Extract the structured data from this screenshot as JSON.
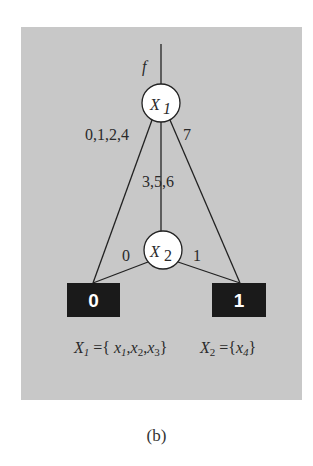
{
  "diagram": {
    "root_label": "f",
    "nodes": [
      {
        "id": "X1",
        "label": "X",
        "subscript": "1"
      },
      {
        "id": "X2",
        "label": "X",
        "subscript": "2"
      }
    ],
    "terminals": [
      {
        "id": "t0",
        "label": "0"
      },
      {
        "id": "t1",
        "label": "1"
      }
    ],
    "edges": [
      {
        "from": "X1",
        "to": "t0",
        "label": "0,1,2,4"
      },
      {
        "from": "X1",
        "to": "X2",
        "label": "3,5,6"
      },
      {
        "from": "X1",
        "to": "t1",
        "label": "7"
      },
      {
        "from": "X2",
        "to": "t0",
        "label": "0"
      },
      {
        "from": "X2",
        "to": "t1",
        "label": "1"
      }
    ],
    "legend": {
      "x1_def": "X1={ x1,x2,x3}",
      "x2_def": "X2={x4}"
    },
    "colors": {
      "background": "#c8c8c8",
      "terminal": "#1a1a1a",
      "node_fill": "#ffffff"
    }
  },
  "caption": "(b)"
}
